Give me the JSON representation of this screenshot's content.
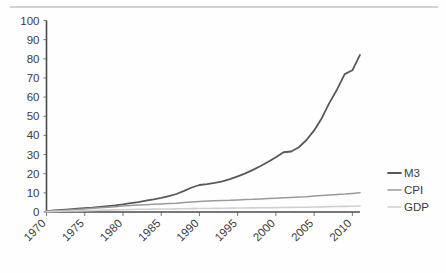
{
  "page": {
    "background_color": "#ffffff",
    "top_rule_color": "#d2d2d2"
  },
  "chart_data": {
    "type": "line",
    "title": "",
    "subtitle": "",
    "xlabel": "",
    "ylabel": "",
    "xlim": [
      1970,
      2011
    ],
    "ylim": [
      0,
      100
    ],
    "y_ticks": [
      0,
      10,
      20,
      30,
      40,
      50,
      60,
      70,
      80,
      90,
      100
    ],
    "x_ticks": [
      1970,
      1975,
      1980,
      1985,
      1990,
      1995,
      2000,
      2005,
      2010
    ],
    "x_tick_labels": [
      "1970",
      "1975",
      "1980",
      "1985",
      "1990",
      "1995",
      "2000",
      "2005",
      "2010"
    ],
    "y_tick_labels": [
      "0",
      "10",
      "20",
      "30",
      "40",
      "50",
      "60",
      "70",
      "80",
      "90",
      "100"
    ],
    "x_tick_rotation_deg": 45,
    "grid": false,
    "legend_position": "right",
    "legend": [
      {
        "name": "M3",
        "color": "#595959"
      },
      {
        "name": "CPI",
        "color": "#9a9a9a"
      },
      {
        "name": "GDP",
        "color": "#d0d0d0"
      }
    ],
    "x": [
      1970,
      1971,
      1972,
      1973,
      1974,
      1975,
      1976,
      1977,
      1978,
      1979,
      1980,
      1981,
      1982,
      1983,
      1984,
      1985,
      1986,
      1987,
      1988,
      1989,
      1990,
      1991,
      1992,
      1993,
      1994,
      1995,
      1996,
      1997,
      1998,
      1999,
      2000,
      2001,
      2002,
      2003,
      2004,
      2005,
      2006,
      2007,
      2008,
      2009,
      2010,
      2011
    ],
    "series": [
      {
        "name": "M3",
        "color": "#595959",
        "stroke_width": 1.8,
        "values": [
          0.5,
          0.8,
          1.1,
          1.4,
          1.7,
          2.0,
          2.3,
          2.7,
          3.1,
          3.5,
          4.0,
          4.6,
          5.2,
          5.9,
          6.6,
          7.4,
          8.3,
          9.4,
          11.0,
          12.8,
          14.1,
          14.6,
          15.2,
          16.0,
          17.2,
          18.6,
          20.2,
          22.0,
          24.0,
          26.2,
          28.6,
          31.2,
          31.6,
          33.8,
          37.6,
          42.6,
          49.0,
          57.0,
          64.0,
          72.0,
          74.0,
          82.0
        ]
      },
      {
        "name": "CPI",
        "color": "#9a9a9a",
        "stroke_width": 1.5,
        "values": [
          0.4,
          0.6,
          0.8,
          1.0,
          1.3,
          1.6,
          1.9,
          2.2,
          2.5,
          2.8,
          3.1,
          3.4,
          3.6,
          3.8,
          4.0,
          4.2,
          4.4,
          4.6,
          4.9,
          5.2,
          5.5,
          5.7,
          5.9,
          6.0,
          6.1,
          6.3,
          6.5,
          6.6,
          6.8,
          7.0,
          7.2,
          7.4,
          7.6,
          7.8,
          8.0,
          8.3,
          8.6,
          8.9,
          9.2,
          9.4,
          9.7,
          10.0
        ]
      },
      {
        "name": "GDP",
        "color": "#d0d0d0",
        "stroke_width": 1.6,
        "values": [
          0.2,
          0.3,
          0.4,
          0.5,
          0.6,
          0.7,
          0.8,
          0.9,
          1.0,
          1.1,
          1.2,
          1.3,
          1.4,
          1.45,
          1.5,
          1.55,
          1.6,
          1.65,
          1.7,
          1.75,
          1.8,
          1.85,
          1.9,
          1.95,
          2.0,
          2.05,
          2.1,
          2.15,
          2.2,
          2.25,
          2.3,
          2.35,
          2.4,
          2.45,
          2.5,
          2.6,
          2.7,
          2.8,
          2.9,
          2.95,
          3.0,
          3.1
        ]
      }
    ],
    "m3_final_value": 94,
    "cpi_final_value": 10,
    "gdp_final_value": 3
  }
}
